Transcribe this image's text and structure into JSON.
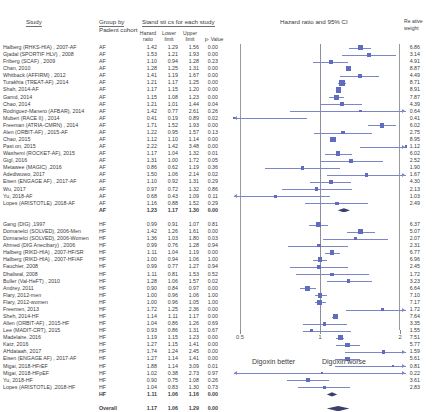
{
  "header": {
    "study": "Study",
    "group_by": "Group by",
    "group_by_sub": "Padent cohort",
    "statistics": "Stand sti cs for each study",
    "hazard_ratio_plot": "Hazard ratio and 95% CI",
    "rel_weight_l1": "Re ative",
    "rel_weight_l2": "weight",
    "col_hazard": "Hazard\nratio",
    "col_lower": "Lower\nlimit",
    "col_upper": "Upper\nlimit",
    "col_p": "p- Value"
  },
  "axis": {
    "ticks": [
      "0.5",
      "1",
      "2"
    ],
    "tick_values": [
      0.5,
      1,
      2
    ],
    "left_label": "Digoxin better",
    "right_label": "Digoxin worse",
    "xmin": 0.5,
    "xmax": 2
  },
  "colors": {
    "marker": "#5f6cc0",
    "ci": "#7b86c9",
    "diamond": "#3a3f6b",
    "axis": "#8e8e9e",
    "text": "#3b3b3b"
  },
  "chart_data": {
    "type": "forest",
    "title": "Hazard ratio and 95% CI",
    "xlabel": "",
    "ylabel": "",
    "xlim": [
      0.5,
      2
    ],
    "xscale": "log",
    "grid": false,
    "columns": [
      "Study",
      "Group by Padent cohort",
      "Hazard ratio",
      "Lower limit",
      "Upper limit",
      "p-Value",
      "Relative weight"
    ],
    "rows": [
      {
        "study": "Halberg (RHKS-HIA) , 2007-AF",
        "group": "AF",
        "hr": 1.42,
        "lower": 1.29,
        "upper": 1.56,
        "p": "0.00",
        "weight": "6.86",
        "kind": "study"
      },
      {
        "study": "Gjadal (SPORTIF HLV) , 2008",
        "group": "AF",
        "hr": 1.53,
        "lower": 1.21,
        "upper": 1.93,
        "p": "0.00",
        "weight": "3.14",
        "kind": "study"
      },
      {
        "study": "Friberg (SCAF) , 2009",
        "group": "AF",
        "hr": 1.1,
        "lower": 0.94,
        "upper": 1.28,
        "p": "0.23",
        "weight": "4.91",
        "kind": "study"
      },
      {
        "study": "Chan, 2010",
        "group": "AF",
        "hr": 1.28,
        "lower": 1.25,
        "upper": 1.31,
        "p": "0.00",
        "weight": "8.87",
        "kind": "study"
      },
      {
        "study": "Whitback (AFFIRM) , 2012",
        "group": "AF",
        "hr": 1.41,
        "lower": 1.19,
        "upper": 1.67,
        "p": "0.00",
        "weight": "4.49",
        "kind": "study"
      },
      {
        "study": "Turakhia (TREAT-AF) ,2014",
        "group": "AF",
        "hr": 1.21,
        "lower": 1.17,
        "upper": 1.25,
        "p": "0.00",
        "weight": "8.71",
        "kind": "study"
      },
      {
        "study": "Shah, 2014-AF",
        "group": "AF",
        "hr": 1.17,
        "lower": 1.15,
        "upper": 1.2,
        "p": "0.00",
        "weight": "8.91",
        "kind": "study"
      },
      {
        "study": "Gamd, 2014",
        "group": "AF",
        "hr": 1.15,
        "lower": 1.08,
        "upper": 1.23,
        "p": "0.00",
        "weight": "7.87",
        "kind": "study"
      },
      {
        "study": "Chao, 2014",
        "group": "AF",
        "hr": 1.21,
        "lower": 1.01,
        "upper": 1.44,
        "p": "0.04",
        "weight": "4.39",
        "kind": "study"
      },
      {
        "study": "Rodriguez-Manero (AFBAR), 2014",
        "group": "AF",
        "hr": 1.42,
        "lower": 0.77,
        "upper": 2.61,
        "p": "0.26",
        "weight": "0.64",
        "kind": "study"
      },
      {
        "study": "Muberi (RACE II) , 2014",
        "group": "AF",
        "hr": 0.41,
        "lower": 0.19,
        "upper": 0.89,
        "p": "0.02",
        "weight": "0.41",
        "kind": "study"
      },
      {
        "study": "Freeman (ATRIA-CMRN) , 2014",
        "group": "AF",
        "hr": 1.71,
        "lower": 1.52,
        "upper": 1.93,
        "p": "0.00",
        "weight": "6.02",
        "kind": "study"
      },
      {
        "study": "Alen (ORBIT-AF) , 2015-AF",
        "group": "AF",
        "hr": 1.22,
        "lower": 0.95,
        "upper": 1.57,
        "p": "0.13",
        "weight": "2.75",
        "kind": "study"
      },
      {
        "study": "Chao, 2015",
        "group": "AF",
        "hr": 1.12,
        "lower": 1.1,
        "upper": 1.14,
        "p": "0.00",
        "weight": "8.95",
        "kind": "study"
      },
      {
        "study": "Past on, 2015",
        "group": "AF",
        "hr": 2.22,
        "lower": 1.42,
        "upper": 3.48,
        "p": "0.00",
        "weight": "1.12",
        "kind": "study"
      },
      {
        "study": "Washemi (ROCKET-AF), 2015",
        "group": "AF",
        "hr": 1.17,
        "lower": 1.04,
        "upper": 1.32,
        "p": "0.01",
        "weight": "6.02",
        "kind": "study"
      },
      {
        "study": "Gigl, 2016",
        "group": "AF",
        "hr": 1.31,
        "lower": 1.0,
        "upper": 1.72,
        "p": "0.05",
        "weight": "2.52",
        "kind": "study"
      },
      {
        "study": "Metawee (MAGIC) ,2016",
        "group": "AF",
        "hr": 0.86,
        "lower": 0.62,
        "upper": 1.19,
        "p": "0.36",
        "weight": "1.90",
        "kind": "study"
      },
      {
        "study": "Adediwuwo, 2017",
        "group": "AF",
        "hr": 1.5,
        "lower": 1.06,
        "upper": 2.14,
        "p": "0.02",
        "weight": "1.67",
        "kind": "study"
      },
      {
        "study": "Eisen (ENGAGE AF) , 2017-AF",
        "group": "AF",
        "hr": 1.1,
        "lower": 0.92,
        "upper": 1.31,
        "p": "0.29",
        "weight": "4.30",
        "kind": "study"
      },
      {
        "study": "Wu, 2017",
        "group": "AF",
        "hr": 0.97,
        "lower": 0.72,
        "upper": 1.32,
        "p": "0.86",
        "weight": "2.13",
        "kind": "study"
      },
      {
        "study": "Yu, 2018-AF",
        "group": "AF",
        "hr": 0.68,
        "lower": 0.43,
        "upper": 1.09,
        "p": "0.11",
        "weight": "1.03",
        "kind": "study"
      },
      {
        "study": "Lopes (ARISTOTLE) ,2018-AF",
        "group": "AF",
        "hr": 1.16,
        "lower": 0.88,
        "upper": 1.52,
        "p": "0.29",
        "weight": "2.49",
        "kind": "study"
      },
      {
        "study": "",
        "group": "AF",
        "hr": 1.23,
        "lower": 1.17,
        "upper": 1.3,
        "p": "0.00",
        "weight": "",
        "kind": "subtotal"
      },
      {
        "study": "Gang (DIG) ,1997",
        "group": "HF",
        "hr": 0.99,
        "lower": 0.91,
        "upper": 1.07,
        "p": "0.81",
        "weight": "6.37",
        "kind": "study"
      },
      {
        "study": "Domanelci (SOLVED), 2006-Men",
        "group": "HF",
        "hr": 1.42,
        "lower": 1.26,
        "upper": 1.61,
        "p": "0.00",
        "weight": "5.07",
        "kind": "study"
      },
      {
        "study": "Domanelci (SOLVED), 2006-Women",
        "group": "HF",
        "hr": 1.36,
        "lower": 1.03,
        "upper": 1.8,
        "p": "0.03",
        "weight": "2.07",
        "kind": "study"
      },
      {
        "study": "Ahmed (DIG Anecibary) , 2006",
        "group": "HF",
        "hr": 0.99,
        "lower": 0.76,
        "upper": 1.28,
        "p": "0.94",
        "weight": "2.31",
        "kind": "study"
      },
      {
        "study": "Halberg (RIKD-HIA) , 2007-HF/SR",
        "group": "HF",
        "hr": 1.11,
        "lower": 1.04,
        "upper": 1.19,
        "p": "0.00",
        "weight": "6.77",
        "kind": "study"
      },
      {
        "study": "Halberg (RIKD-HIA) , 2007-HF/AF",
        "group": "HF",
        "hr": 1.0,
        "lower": 0.94,
        "upper": 1.06,
        "p": "1.00",
        "weight": "6.96",
        "kind": "study"
      },
      {
        "study": "Fauchier, 2008",
        "group": "HF",
        "hr": 0.99,
        "lower": 0.77,
        "upper": 1.27,
        "p": "0.94",
        "weight": "2.45",
        "kind": "study"
      },
      {
        "study": "Dhaliwal, 2008",
        "group": "HF",
        "hr": 1.11,
        "lower": 0.81,
        "upper": 1.53,
        "p": "0.52",
        "weight": "1.72",
        "kind": "study"
      },
      {
        "study": "Buller (Val-HeFT) , 2010",
        "group": "HF",
        "hr": 1.28,
        "lower": 1.06,
        "upper": 1.57,
        "p": "0.02",
        "weight": "3.23",
        "kind": "study"
      },
      {
        "study": "Andrey, 2011",
        "group": "HF",
        "hr": 0.9,
        "lower": 0.84,
        "upper": 0.97,
        "p": "0.00",
        "weight": "6.64",
        "kind": "study"
      },
      {
        "study": "Flary, 2012-men",
        "group": "HF",
        "hr": 1.0,
        "lower": 0.96,
        "upper": 1.06,
        "p": "1.00",
        "weight": "7.10",
        "kind": "study"
      },
      {
        "study": "Flary, 2012-women",
        "group": "HF",
        "hr": 1.0,
        "lower": 0.96,
        "upper": 1.05,
        "p": "1.00",
        "weight": "7.17",
        "kind": "study"
      },
      {
        "study": "Freemen, 2013",
        "group": "HF",
        "hr": 1.72,
        "lower": 1.25,
        "upper": 2.36,
        "p": "0.00",
        "weight": "1.72",
        "kind": "study"
      },
      {
        "study": "Sheh, 2014-HF",
        "group": "HF",
        "hr": 1.14,
        "lower": 1.11,
        "upper": 1.17,
        "p": "0.00",
        "weight": "7.64",
        "kind": "study"
      },
      {
        "study": "Allen (ORBIT-AF) , 2015-HF",
        "group": "HF",
        "hr": 1.04,
        "lower": 0.86,
        "upper": 1.26,
        "p": "0.69",
        "weight": "3.35",
        "kind": "study"
      },
      {
        "study": "Lee (MADIT-CRT), 2015",
        "group": "HF",
        "hr": 0.93,
        "lower": 0.86,
        "upper": 1.31,
        "p": "0.67",
        "weight": "1.55",
        "kind": "study"
      },
      {
        "study": "Madelaire, 2016",
        "group": "HF",
        "hr": 1.19,
        "lower": 1.15,
        "upper": 1.23,
        "p": "0.00",
        "weight": "7.51",
        "kind": "study"
      },
      {
        "study": "Katz, 2016",
        "group": "HF",
        "hr": 1.27,
        "lower": 1.15,
        "upper": 1.41,
        "p": "0.00",
        "weight": "5.77",
        "kind": "study"
      },
      {
        "study": "AHdataah, 2017",
        "group": "HF",
        "hr": 1.74,
        "lower": 1.24,
        "upper": 2.45,
        "p": "0.00",
        "weight": "1.59",
        "kind": "study"
      },
      {
        "study": "Eisen (ENGAGE AF) , 2017-AF",
        "group": "HF",
        "hr": 1.27,
        "lower": 1.14,
        "upper": 1.41,
        "p": "0.00",
        "weight": "5.61",
        "kind": "study"
      },
      {
        "study": "Migai, 2018-HFrEF",
        "group": "HF",
        "hr": 1.88,
        "lower": 1.14,
        "upper": 3.09,
        "p": "0.01",
        "weight": "0.81",
        "kind": "study"
      },
      {
        "study": "Migai, 2018-HFpEF",
        "group": "HF",
        "hr": 1.02,
        "lower": 0.38,
        "upper": 2.73,
        "p": "0.97",
        "weight": "0.22",
        "kind": "study"
      },
      {
        "study": "Yu, 2018-HF",
        "group": "HF",
        "hr": 0.9,
        "lower": 0.75,
        "upper": 1.08,
        "p": "0.26",
        "weight": "3.61",
        "kind": "study"
      },
      {
        "study": "Lopes (ARISTOTLE) ,2018-HF",
        "group": "HF",
        "hr": 1.04,
        "lower": 0.83,
        "upper": 1.3,
        "p": "0.73",
        "weight": "2.83",
        "kind": "study"
      },
      {
        "study": "",
        "group": "HF",
        "hr": 1.11,
        "lower": 1.06,
        "upper": 1.16,
        "p": "0.00",
        "weight": "",
        "kind": "subtotal"
      },
      {
        "study": "",
        "group": "Overall",
        "hr": 1.17,
        "lower": 1.06,
        "upper": 1.29,
        "p": "0.00",
        "weight": "",
        "kind": "overall"
      }
    ]
  }
}
